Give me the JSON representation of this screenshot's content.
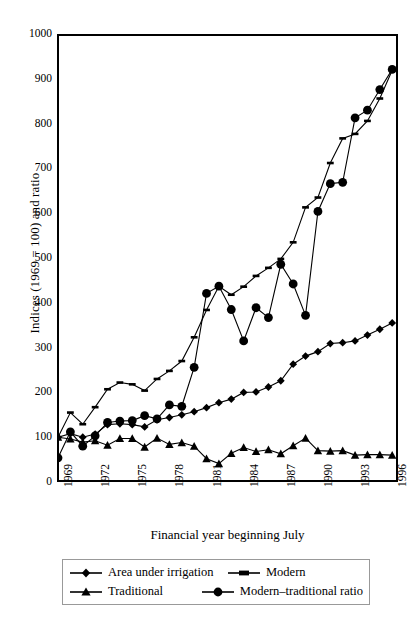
{
  "chart_data": {
    "type": "line",
    "title": "",
    "xlabel": "Financial year beginning July",
    "ylabel": "Indices (1969 = 100) and ratio",
    "ylim": [
      0,
      1000
    ],
    "y_ticks": [
      0,
      100,
      200,
      300,
      400,
      500,
      600,
      700,
      800,
      900,
      1000
    ],
    "x_ticks": [
      "1969",
      "1972",
      "1975",
      "1978",
      "1981",
      "1984",
      "1987",
      "1990",
      "1993",
      "1996"
    ],
    "x": [
      1969,
      1970,
      1971,
      1972,
      1973,
      1974,
      1975,
      1976,
      1977,
      1978,
      1979,
      1980,
      1981,
      1982,
      1983,
      1984,
      1985,
      1986,
      1987,
      1988,
      1989,
      1990,
      1991,
      1992,
      1993,
      1994,
      1995,
      1996
    ],
    "grid": false,
    "legend_position": "below-axes",
    "series": [
      {
        "name": "Area under irrigation",
        "marker": "diamond",
        "values": [
          100,
          108,
          100,
          107,
          128,
          130,
          128,
          123,
          139,
          144,
          150,
          157,
          166,
          177,
          185,
          200,
          201,
          212,
          226,
          263,
          281,
          291,
          309,
          311,
          315,
          328,
          341,
          355
        ]
      },
      {
        "name": "Modern",
        "marker": "plus-tick",
        "values": [
          100,
          155,
          129,
          167,
          207,
          222,
          218,
          204,
          230,
          248,
          270,
          323,
          384,
          437,
          418,
          436,
          460,
          478,
          498,
          535,
          613,
          635,
          712,
          767,
          777,
          806,
          856,
          919
        ]
      },
      {
        "name": "Traditional",
        "marker": "triangle",
        "values": [
          100,
          96,
          89,
          92,
          82,
          97,
          97,
          78,
          98,
          84,
          88,
          80,
          52,
          41,
          64,
          77,
          68,
          72,
          63,
          81,
          98,
          70,
          69,
          70,
          60,
          61,
          61,
          60
        ]
      },
      {
        "name": "Modern–traditional ratio",
        "marker": "circle",
        "values": [
          54,
          112,
          80,
          103,
          133,
          136,
          137,
          148,
          141,
          172,
          169,
          256,
          421,
          437,
          385,
          315,
          389,
          367,
          486,
          442,
          372,
          604,
          666,
          669,
          813,
          830,
          876,
          921
        ]
      }
    ]
  },
  "legend": {
    "entries": [
      {
        "label": "Area under irrigation",
        "marker": "diamond"
      },
      {
        "label": "Modern",
        "marker": "plus-tick"
      },
      {
        "label": "Traditional",
        "marker": "triangle"
      },
      {
        "label": "Modern–traditional ratio",
        "marker": "circle"
      }
    ]
  },
  "axes": {
    "y_title": "Indices (1969 = 100) and ratio",
    "x_title": "Financial year beginning July"
  }
}
